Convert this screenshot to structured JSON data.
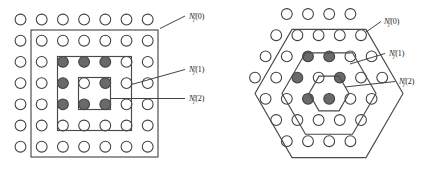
{
  "figure": {
    "kind": "two-panel-lattice-neighborhood-diagram",
    "background": "#ffffff",
    "width": 435,
    "height": 173,
    "colors": {
      "node_outline": "#3f3f3f",
      "node_empty_fill": "#ffffff",
      "node_marked_fill": "#6a6a6a",
      "boundary_stroke": "#4a4a4a",
      "leader_stroke": "#3a3a3a",
      "label_color": "#1a1a1a"
    },
    "node_radius": 5.4,
    "marked_node_radius": 5.4
  },
  "labels": {
    "base_symbol": "N",
    "superscript": "r",
    "subscript": "j",
    "open_paren": "(",
    "close_paren": ")",
    "ring_0": "0",
    "ring_1": "1",
    "ring_2": "2",
    "full_0": "N'j(0)",
    "full_1": "N'j(1)",
    "full_2": "N'j(2)"
  },
  "panels": [
    {
      "id": "square-lattice",
      "name": "square-lattice-panel",
      "lattice": "square",
      "rows": 7,
      "cols": 7,
      "spacing_x": 21.2,
      "spacing_y": 21.2,
      "origin": {
        "x": 20.5,
        "y": 19.5
      },
      "marked_nodes": [
        {
          "row": 2,
          "col": 2
        },
        {
          "row": 2,
          "col": 3
        },
        {
          "row": 2,
          "col": 4
        },
        {
          "row": 3,
          "col": 2
        },
        {
          "row": 3,
          "col": 4
        },
        {
          "row": 4,
          "col": 2
        },
        {
          "row": 4,
          "col": 3
        },
        {
          "row": 4,
          "col": 4
        }
      ],
      "center_node": {
        "row": 3,
        "col": 3
      },
      "boundaries": [
        {
          "ring": "2",
          "x": 31.0,
          "y": 30.0,
          "w": 127.0,
          "h": 127.0
        },
        {
          "ring": "1",
          "x": 57.5,
          "y": 56.5,
          "w": 74.0,
          "h": 74.0
        },
        {
          "ring": "0",
          "x": 78.5,
          "y": 77.5,
          "w": 32.0,
          "h": 32.0
        }
      ],
      "label_anchors": [
        {
          "ring": "0",
          "text_x": 189.0,
          "text_y": 19.0,
          "leader": "M 160.0,28.5 L 185.0,16.0"
        },
        {
          "ring": "1",
          "text_x": 189.0,
          "text_y": 72.0,
          "leader": "M 131.5,84.5 L 185.0,69.5"
        },
        {
          "ring": "2",
          "text_x": 189.0,
          "text_y": 101.0,
          "leader": "M 110.0,98.5 L 185.0,98.5"
        }
      ]
    },
    {
      "id": "hex-lattice",
      "name": "hex-lattice-panel",
      "lattice": "hexagonal",
      "row_counts": [
        4,
        5,
        6,
        7,
        6,
        5,
        4
      ],
      "spacing_x": 21.2,
      "spacing_y": 21.2,
      "origin": {
        "x": 255.0,
        "y": 14.0
      },
      "center_node": {
        "row": 3,
        "col": 3
      },
      "marked_nodes": [
        {
          "row": 2,
          "col": 2
        },
        {
          "row": 2,
          "col": 3
        },
        {
          "row": 3,
          "col": 2
        },
        {
          "row": 3,
          "col": 4
        },
        {
          "row": 4,
          "col": 2
        },
        {
          "row": 4,
          "col": 3
        }
      ],
      "boundaries": [
        {
          "ring": "2",
          "radius": 74.0
        },
        {
          "ring": "1",
          "radius": 47.0
        },
        {
          "ring": "0",
          "radius": 20.0
        }
      ],
      "hex_center": {
        "x": 329.0,
        "y": 93.5
      },
      "label_anchors": [
        {
          "ring": "0",
          "text_x": 384.0,
          "text_y": 24.0,
          "leader": "M 366.0,32.0 L 381.0,21.5"
        },
        {
          "ring": "1",
          "text_x": 389.0,
          "text_y": 56.0,
          "leader": "M 350.0,64.0 L 385.0,53.5"
        },
        {
          "ring": "2",
          "text_x": 399.0,
          "text_y": 84.0,
          "leader": "M 345.0,87.0 L 395.0,81.5"
        }
      ]
    }
  ]
}
